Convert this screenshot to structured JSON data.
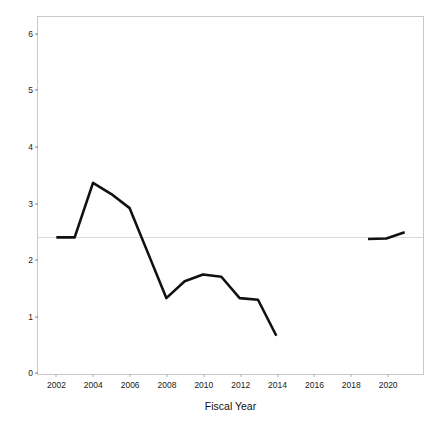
{
  "chart_data": {
    "type": "line",
    "title": "",
    "xlabel": "Fiscal Year",
    "ylabel": "Millions (Constant 2019 USD)",
    "xlim": [
      2001,
      2022
    ],
    "ylim": [
      -0.05,
      6.3
    ],
    "xticks": [
      2002,
      2004,
      2006,
      2008,
      2010,
      2012,
      2014,
      2016,
      2018,
      2020
    ],
    "xticklabels": [
      "2002",
      "2004",
      "2006",
      "2008",
      "2010",
      "2012",
      "2014",
      "2016",
      "2018",
      "2020"
    ],
    "yticks": [
      0,
      1,
      2,
      3,
      4,
      5,
      6
    ],
    "yticklabels": [
      "0",
      "1",
      "2",
      "3",
      "4",
      "5",
      "6"
    ],
    "grid": false,
    "legend": null,
    "line_color": "#111111",
    "reference_line": {
      "value": 2.4,
      "color": "#d9d9d9",
      "orientation": "horizontal"
    },
    "series": [
      {
        "name": "Funding",
        "x": [
          2002,
          2003,
          2004,
          2005,
          2006,
          2007,
          2008,
          2009,
          2010,
          2011,
          2012,
          2013,
          2014
        ],
        "values": [
          2.38,
          2.38,
          3.35,
          3.15,
          2.9,
          2.1,
          1.3,
          1.6,
          1.72,
          1.68,
          1.3,
          1.27,
          0.63
        ]
      },
      {
        "name": "Funding (resumed)",
        "x": [
          2019,
          2020,
          2021
        ],
        "values": [
          2.35,
          2.36,
          2.47
        ]
      }
    ],
    "gap_years": [
      2015,
      2016,
      2017,
      2018
    ]
  }
}
